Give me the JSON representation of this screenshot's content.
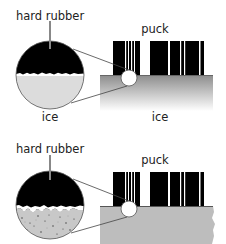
{
  "panels": [
    {
      "id": "smooth-ice",
      "magnified_label": "hard rubber",
      "magnified_bottom_label": "ice",
      "puck_label": "puck",
      "surface_label": "ice",
      "surface_style": "smooth-gradient"
    },
    {
      "id": "rough-surface",
      "magnified_label": "hard rubber",
      "puck_label": "puck",
      "surface_style": "rough-textured"
    }
  ],
  "colors": {
    "rubber": "#000000",
    "smooth_ice": "#dcdcdc",
    "rough_surface": "#c8c8c8",
    "surface_gradient_top": "#8c8c8c",
    "surface_gradient_bottom": "#ffffff",
    "rough_ground": "#bdbdbd",
    "outline": "#555555"
  }
}
